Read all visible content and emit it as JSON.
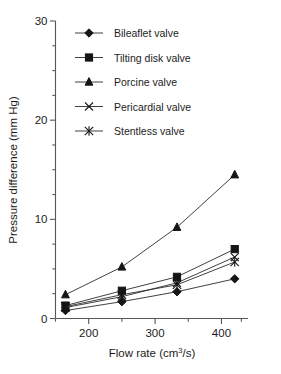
{
  "chart_data": {
    "type": "line",
    "title": "",
    "xlabel": "Flow rate (cm3/s)",
    "xlabel_base": "Flow rate (cm",
    "xlabel_sup": "3",
    "xlabel_tail": "/s)",
    "ylabel": "Pressure difference (mm Hg)",
    "xlim": [
      150,
      440
    ],
    "ylim": [
      0,
      30
    ],
    "grid": false,
    "legend_position": "upper-left-inside",
    "x": [
      165,
      250,
      333,
      420
    ],
    "xticks": [
      200,
      300,
      400
    ],
    "xticklabels": [
      "200",
      "300",
      "400"
    ],
    "xminorticks": [
      150,
      250,
      350,
      430
    ],
    "yticks": [
      0,
      10,
      20,
      30
    ],
    "yticklabels": [
      "0",
      "10",
      "20",
      "30"
    ],
    "yminorticks": [
      2.5,
      5,
      7.5,
      12.5,
      15,
      17.5,
      22.5,
      25,
      27.5
    ],
    "series": [
      {
        "name": "Bileaflet valve",
        "marker": "diamond",
        "values": [
          0.8,
          1.7,
          2.7,
          4.0
        ]
      },
      {
        "name": "Tilting disk valve",
        "marker": "square",
        "values": [
          1.3,
          2.8,
          4.2,
          7.0
        ]
      },
      {
        "name": "Porcine valve",
        "marker": "triangle",
        "values": [
          2.4,
          5.2,
          9.2,
          14.5
        ]
      },
      {
        "name": "Pericardial valve",
        "marker": "x",
        "values": [
          1.1,
          2.2,
          3.6,
          6.2
        ]
      },
      {
        "name": "Stentless valve",
        "marker": "asterisk",
        "values": [
          1.2,
          2.4,
          3.4,
          5.7
        ]
      }
    ]
  },
  "legend": {
    "entries": [
      {
        "label": "Bileaflet valve",
        "marker": "diamond-marker-icon"
      },
      {
        "label": "Tilting disk valve",
        "marker": "square-marker-icon"
      },
      {
        "label": "Porcine valve",
        "marker": "triangle-marker-icon"
      },
      {
        "label": "Pericardial valve",
        "marker": "x-marker-icon"
      },
      {
        "label": "Stentless valve",
        "marker": "asterisk-marker-icon"
      }
    ]
  },
  "colors": {
    "series": "#151515",
    "axis": "#55585c",
    "text": "#1c1c1c",
    "background": "#ffffff"
  }
}
